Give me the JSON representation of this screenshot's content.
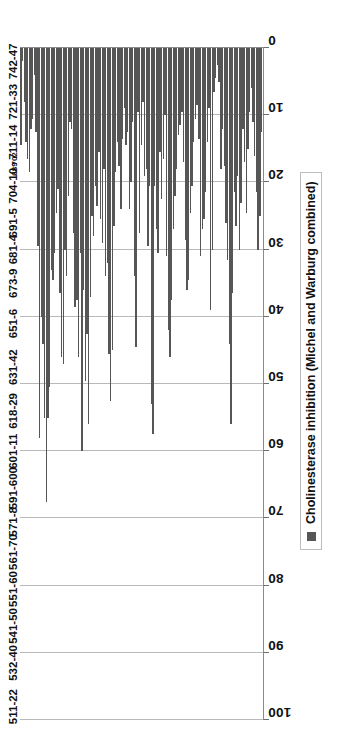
{
  "chart_data": {
    "type": "bar",
    "orientation": "horizontal",
    "title": "",
    "subtitle": "",
    "xlabel": "",
    "ylabel": "",
    "xlim": [
      0,
      100
    ],
    "xticks": [
      0,
      10,
      20,
      30,
      40,
      50,
      60,
      70,
      80,
      90,
      100
    ],
    "xticklabels": [
      "0",
      "10",
      "20",
      "30",
      "40",
      "50",
      "60",
      "70",
      "80",
      "90",
      "100"
    ],
    "grid": true,
    "grid_axis": "x",
    "legend": {
      "position": "bottom-right",
      "entries": [
        {
          "label": "Cholinesterase inhibition (Michel and Warburg combined)",
          "color": "#565656"
        }
      ]
    },
    "bar_color": "#565656",
    "gridline_color": "#b9b9b9",
    "axis_color": "#8a8a8a",
    "series": [
      {
        "name": "Cholinesterase inhibition (Michel and Warburg combined)",
        "values": [
          14.5,
          2.0,
          8.0,
          14.0,
          16.5,
          18.5,
          12.0,
          10.5,
          4.0,
          12.5,
          29.5,
          58.0,
          40.0,
          44.0,
          55.0,
          67.5,
          55.0,
          50.5,
          33.0,
          34.5,
          30.5,
          24.5,
          21.0,
          36.5,
          46.0,
          47.0,
          30.0,
          34.0,
          22.0,
          11.0,
          12.0,
          27.5,
          38.5,
          37.5,
          46.0,
          30.5,
          60.0,
          36.0,
          49.5,
          42.5,
          56.0,
          37.0,
          25.0,
          28.0,
          20.5,
          23.5,
          15.5,
          25.5,
          29.0,
          18.0,
          34.0,
          32.0,
          45.5,
          52.5,
          45.0,
          26.5,
          18.5,
          14.0,
          17.5,
          24.0,
          13.5,
          9.0,
          14.5,
          12.5,
          24.0,
          20.0,
          11.0,
          34.0,
          44.5,
          9.5,
          27.5,
          14.5,
          8.0,
          19.0,
          18.0,
          29.5,
          20.5,
          53.0,
          57.5,
          20.5,
          27.0,
          30.5,
          15.5,
          22.5,
          16.5,
          10.0,
          31.0,
          42.0,
          46.0,
          37.5,
          27.0,
          22.0,
          18.0,
          13.0,
          11.5,
          9.5,
          17.0,
          28.5,
          36.0,
          34.5,
          24.5,
          20.5,
          14.0,
          10.5,
          8.5,
          13.5,
          31.0,
          27.0,
          25.5,
          21.5,
          14.0,
          9.0,
          39.0,
          30.0,
          6.5,
          4.5,
          2.5,
          5.0,
          18.0,
          12.0,
          17.5,
          26.0,
          31.5,
          44.0,
          56.0,
          36.5,
          21.5,
          26.5,
          19.0,
          30.0,
          23.0,
          12.0,
          17.0,
          24.5,
          15.0,
          9.5,
          6.0,
          11.0,
          16.0,
          21.5,
          30.0,
          25.0,
          12.5,
          7.0
        ]
      }
    ],
    "category_tick_labels": [
      {
        "label": "742-47",
        "index": 4,
        "size": "normal"
      },
      {
        "label": "721-33",
        "index": 16,
        "size": "normal"
      },
      {
        "label": "711-14",
        "index": 28,
        "size": "normal"
      },
      {
        "label": "702",
        "index": 33,
        "size": "tiny"
      },
      {
        "label": "689",
        "index": 36,
        "size": "tiny"
      },
      {
        "label": "704-10",
        "index": 41,
        "size": "normal"
      },
      {
        "label": "691-5",
        "index": 52,
        "size": "normal"
      },
      {
        "label": "681-4",
        "index": 60,
        "size": "normal"
      },
      {
        "label": "673-9",
        "index": 70,
        "size": "normal"
      },
      {
        "label": "651-6",
        "index": 82,
        "size": "normal"
      },
      {
        "label": "631-42",
        "index": 95,
        "size": "normal"
      },
      {
        "label": "618-29",
        "index": 108,
        "size": "normal"
      },
      {
        "label": "601-11",
        "index": 120,
        "size": "normal"
      },
      {
        "label": "591-600",
        "index": 131,
        "size": "normal"
      },
      {
        "label": "571-8",
        "index": 141,
        "size": "normal"
      },
      {
        "label": "561-70",
        "index": 150,
        "size": "normal"
      },
      {
        "label": "551-60",
        "index": 161,
        "size": "normal"
      },
      {
        "label": "541-50",
        "index": 172,
        "size": "normal"
      },
      {
        "label": "532-40",
        "index": 183,
        "size": "normal"
      },
      {
        "label": "511-22",
        "index": 196,
        "size": "normal"
      }
    ]
  },
  "legend": {
    "label": "Cholinesterase inhibition (Michel and Warburg combined)",
    "swatch_color": "#565656"
  }
}
